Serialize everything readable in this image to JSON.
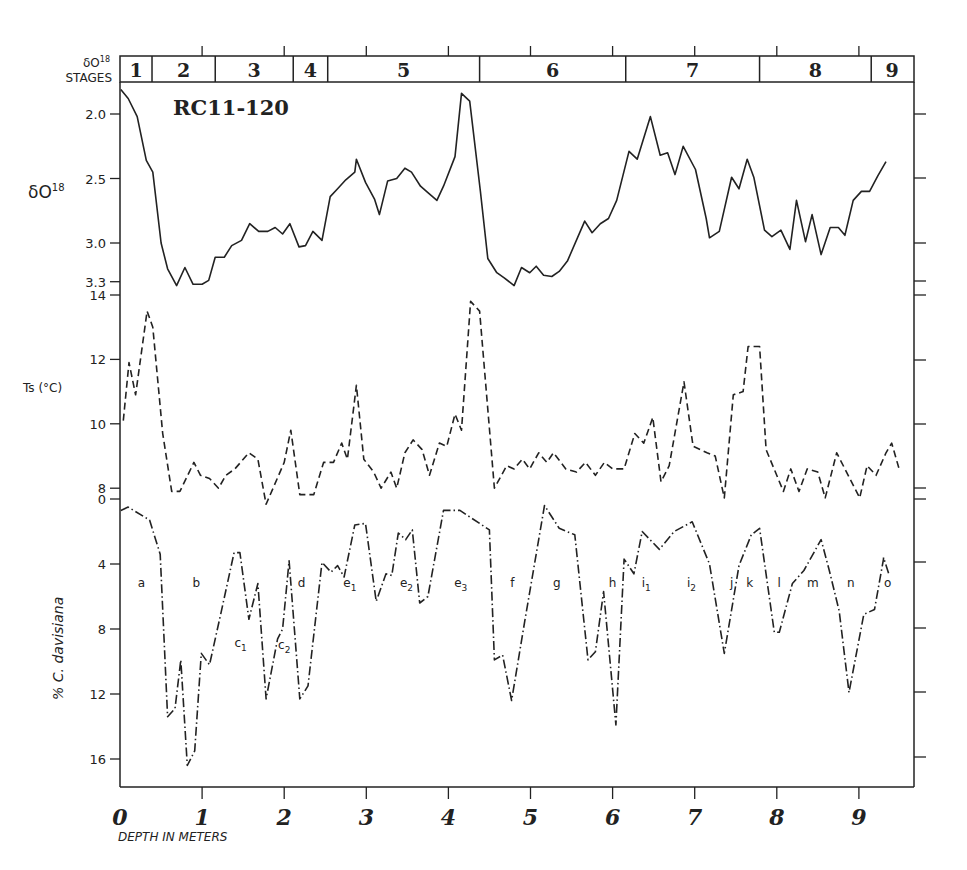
{
  "chart_data": {
    "type": "line",
    "title": "RC11-120",
    "xlabel": "DEPTH IN METERS",
    "x_ticks": [
      "0",
      "1",
      "2",
      "3",
      "4",
      "5",
      "6",
      "7",
      "8",
      "9"
    ],
    "xlim": [
      0,
      9.6
    ],
    "stages": {
      "label_line1": "δO18",
      "label_line2": "STAGES",
      "items": [
        {
          "label": "1",
          "from": 0.0,
          "to": 0.39
        },
        {
          "label": "2",
          "from": 0.39,
          "to": 1.16
        },
        {
          "label": "3",
          "from": 1.16,
          "to": 2.11
        },
        {
          "label": "4",
          "from": 2.11,
          "to": 2.53
        },
        {
          "label": "5",
          "from": 2.53,
          "to": 4.38
        },
        {
          "label": "6",
          "from": 4.38,
          "to": 6.16
        },
        {
          "label": "7",
          "from": 6.16,
          "to": 7.79
        },
        {
          "label": "8",
          "from": 7.79,
          "to": 9.15
        },
        {
          "label": "9",
          "from": 9.15,
          "to": 9.66
        }
      ]
    },
    "panels": [
      {
        "name": "delta18O",
        "ylabel": "δO18",
        "y_ticks": [
          "2.0",
          "2.5",
          "3.0",
          "3.3"
        ],
        "ylim": [
          1.8,
          3.3
        ],
        "inverted": true,
        "line_style": "solid",
        "x": [
          0.01,
          0.1,
          0.21,
          0.32,
          0.4,
          0.5,
          0.58,
          0.69,
          0.79,
          0.89,
          1.0,
          1.08,
          1.16,
          1.27,
          1.36,
          1.48,
          1.58,
          1.69,
          1.8,
          1.89,
          1.98,
          2.07,
          2.18,
          2.26,
          2.35,
          2.46,
          2.56,
          2.65,
          2.75,
          2.86,
          2.88,
          2.99,
          3.1,
          3.16,
          3.26,
          3.37,
          3.47,
          3.55,
          3.66,
          3.75,
          3.86,
          3.94,
          4.08,
          4.16,
          4.26,
          4.39,
          4.48,
          4.59,
          4.68,
          4.8,
          4.89,
          4.99,
          5.07,
          5.16,
          5.26,
          5.35,
          5.45,
          5.66,
          5.75,
          5.85,
          5.95,
          6.05,
          6.2,
          6.3,
          6.46,
          6.58,
          6.67,
          6.76,
          6.86,
          7.01,
          7.14,
          7.18,
          7.3,
          7.45,
          7.54,
          7.64,
          7.72,
          7.85,
          7.94,
          8.05,
          8.16,
          8.24,
          8.35,
          8.43,
          8.54,
          8.65,
          8.75,
          8.83,
          8.93,
          9.03,
          9.13,
          9.23,
          9.33
        ],
        "values": [
          1.81,
          1.88,
          2.02,
          2.36,
          2.45,
          3.0,
          3.2,
          3.33,
          3.19,
          3.32,
          3.32,
          3.29,
          3.11,
          3.11,
          3.02,
          2.98,
          2.85,
          2.91,
          2.91,
          2.88,
          2.93,
          2.85,
          3.03,
          3.02,
          2.91,
          2.98,
          2.64,
          2.58,
          2.51,
          2.45,
          2.35,
          2.53,
          2.66,
          2.78,
          2.52,
          2.5,
          2.42,
          2.45,
          2.56,
          2.61,
          2.67,
          2.56,
          2.33,
          1.84,
          1.9,
          2.6,
          3.12,
          3.23,
          3.27,
          3.33,
          3.19,
          3.23,
          3.18,
          3.25,
          3.26,
          3.22,
          3.14,
          2.83,
          2.92,
          2.85,
          2.81,
          2.67,
          2.29,
          2.35,
          2.02,
          2.32,
          2.3,
          2.47,
          2.25,
          2.43,
          2.81,
          2.96,
          2.91,
          2.49,
          2.58,
          2.35,
          2.49,
          2.9,
          2.95,
          2.9,
          3.05,
          2.67,
          2.99,
          2.78,
          3.09,
          2.88,
          2.88,
          2.94,
          2.67,
          2.6,
          2.6,
          2.48,
          2.37,
          2.48
        ]
      },
      {
        "name": "Ts",
        "ylabel": "Ts (°C)",
        "y_ticks": [
          "14",
          "12",
          "10",
          "8"
        ],
        "ylim": [
          7.8,
          14
        ],
        "inverted": false,
        "line_style": "dashed",
        "x": [
          0.04,
          0.11,
          0.19,
          0.33,
          0.4,
          0.52,
          0.63,
          0.73,
          0.9,
          0.98,
          1.09,
          1.2,
          1.29,
          1.4,
          1.57,
          1.68,
          1.78,
          2.0,
          2.08,
          2.19,
          2.36,
          2.48,
          2.6,
          2.7,
          2.77,
          2.88,
          2.97,
          3.09,
          3.18,
          3.3,
          3.37,
          3.47,
          3.57,
          3.68,
          3.77,
          3.89,
          3.98,
          4.08,
          4.16,
          4.27,
          4.38,
          4.56,
          4.71,
          4.8,
          4.9,
          4.99,
          5.1,
          5.2,
          5.28,
          5.43,
          5.56,
          5.67,
          5.79,
          5.9,
          6.0,
          6.14,
          6.27,
          6.38,
          6.49,
          6.59,
          6.69,
          6.87,
          6.98,
          7.15,
          7.25,
          7.36,
          7.47,
          7.59,
          7.65,
          7.79,
          7.87,
          8.08,
          8.17,
          8.27,
          8.37,
          8.5,
          8.59,
          8.73,
          9.01,
          9.1,
          9.21,
          9.33,
          9.4,
          9.49
        ],
        "values": [
          10.1,
          11.9,
          10.9,
          13.5,
          13.0,
          9.7,
          7.9,
          7.9,
          8.8,
          8.4,
          8.3,
          8.0,
          8.4,
          8.6,
          9.1,
          8.9,
          7.5,
          8.8,
          9.8,
          7.8,
          7.8,
          8.8,
          8.8,
          9.4,
          8.9,
          11.2,
          8.9,
          8.5,
          8.0,
          8.5,
          8.0,
          9.1,
          9.5,
          9.2,
          8.4,
          9.4,
          9.3,
          10.3,
          9.8,
          13.8,
          13.5,
          8.0,
          8.7,
          8.6,
          8.9,
          8.6,
          9.1,
          8.8,
          9.1,
          8.6,
          8.5,
          8.8,
          8.4,
          8.8,
          8.6,
          8.6,
          9.7,
          9.4,
          10.2,
          8.2,
          8.7,
          11.3,
          9.3,
          9.1,
          9.0,
          7.7,
          10.9,
          11.0,
          12.4,
          12.4,
          9.2,
          7.9,
          8.6,
          7.9,
          8.6,
          8.5,
          7.7,
          9.1,
          7.7,
          8.7,
          8.4,
          9.1,
          9.4,
          8.6
        ]
      },
      {
        "name": "C_davisiana",
        "ylabel": "% C. davisiana",
        "y_ticks": [
          "0",
          "4",
          "8",
          "12",
          "16"
        ],
        "ylim": [
          0,
          17.8
        ],
        "inverted": true,
        "line_style": "dashdot",
        "x": [
          0.01,
          0.1,
          0.36,
          0.49,
          0.58,
          0.67,
          0.74,
          0.82,
          0.91,
          0.99,
          1.09,
          1.23,
          1.39,
          1.46,
          1.57,
          1.68,
          1.78,
          1.92,
          1.98,
          2.06,
          2.19,
          2.29,
          2.46,
          2.57,
          2.65,
          2.73,
          2.86,
          2.99,
          3.12,
          3.24,
          3.31,
          3.39,
          3.48,
          3.56,
          3.65,
          3.75,
          3.94,
          4.14,
          4.5,
          4.56,
          4.66,
          4.77,
          4.93,
          5.17,
          5.35,
          5.54,
          5.7,
          5.79,
          5.89,
          6.04,
          6.14,
          6.26,
          6.36,
          6.57,
          6.75,
          6.97,
          7.18,
          7.36,
          7.54,
          7.69,
          7.79,
          7.97,
          8.03,
          8.19,
          8.33,
          8.54,
          8.64,
          8.76,
          8.88,
          9.06,
          9.19,
          9.3,
          9.3,
          9.37
        ],
        "values": [
          0.7,
          0.5,
          1.3,
          3.4,
          13.4,
          12.9,
          9.9,
          16.4,
          15.5,
          9.5,
          10.2,
          7.0,
          3.3,
          3.3,
          7.4,
          5.2,
          12.3,
          8.6,
          8.0,
          3.8,
          12.3,
          11.5,
          3.9,
          4.5,
          4.1,
          4.8,
          1.6,
          1.5,
          6.3,
          4.6,
          4.7,
          2.1,
          2.5,
          1.9,
          6.4,
          6.0,
          0.7,
          0.7,
          1.9,
          9.9,
          9.6,
          12.4,
          7.5,
          0.4,
          1.8,
          2.2,
          9.9,
          9.4,
          5.7,
          13.9,
          3.7,
          4.6,
          2.0,
          3.1,
          2.0,
          1.4,
          4.0,
          9.5,
          4.1,
          2.2,
          1.8,
          8.2,
          8.2,
          5.2,
          4.4,
          2.5,
          4.4,
          6.9,
          11.9,
          7.1,
          6.8,
          3.7,
          3.6,
          4.7
        ]
      }
    ],
    "zone_labels": [
      {
        "text": "a",
        "x": 0.26,
        "y": 5.4
      },
      {
        "text": "b",
        "x": 0.93,
        "y": 5.4
      },
      {
        "text": "c1",
        "x": 1.47,
        "y": 9.1
      },
      {
        "text": "c2",
        "x": 2.0,
        "y": 9.2
      },
      {
        "text": "d",
        "x": 2.21,
        "y": 5.4
      },
      {
        "text": "e1",
        "x": 2.8,
        "y": 5.4
      },
      {
        "text": "e2",
        "x": 3.49,
        "y": 5.4
      },
      {
        "text": "e3",
        "x": 4.15,
        "y": 5.4
      },
      {
        "text": "f",
        "x": 4.78,
        "y": 5.4
      },
      {
        "text": "g",
        "x": 5.32,
        "y": 5.4
      },
      {
        "text": "h",
        "x": 6.0,
        "y": 5.4
      },
      {
        "text": "i1",
        "x": 6.41,
        "y": 5.4
      },
      {
        "text": "i2",
        "x": 6.96,
        "y": 5.4
      },
      {
        "text": "j",
        "x": 7.45,
        "y": 5.4
      },
      {
        "text": "k",
        "x": 7.67,
        "y": 5.4
      },
      {
        "text": "l",
        "x": 8.03,
        "y": 5.4
      },
      {
        "text": "m",
        "x": 8.44,
        "y": 5.4
      },
      {
        "text": "n",
        "x": 8.9,
        "y": 5.4
      },
      {
        "text": "o",
        "x": 9.35,
        "y": 5.4
      }
    ]
  }
}
